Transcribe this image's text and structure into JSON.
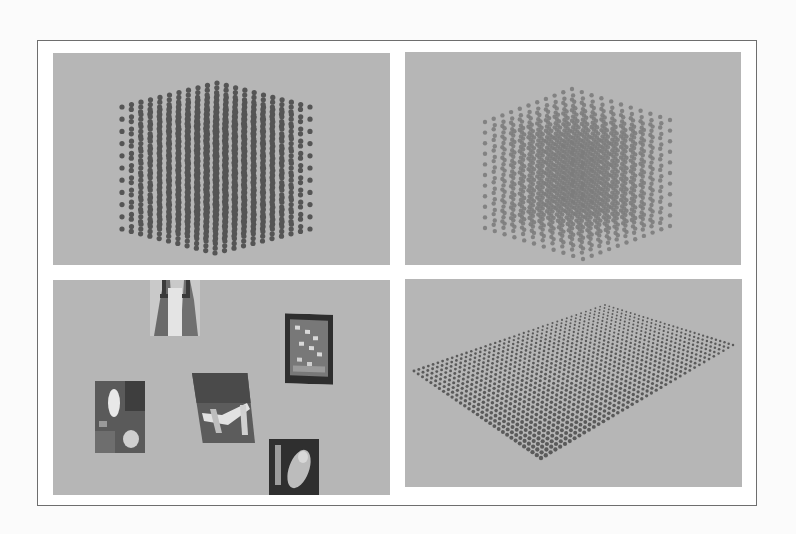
{
  "figure": {
    "layout": "2x2 grid",
    "background_color": "#b6b6b6",
    "panels": [
      {
        "position": "top-left",
        "content": "3D cube lattice of spheres (dense, dark)",
        "dot_color": "#555555",
        "grid_size": 11
      },
      {
        "position": "top-right",
        "content": "3D cube lattice of spheres (lighter, separated)",
        "dot_color": "#7c7c7c",
        "grid_size": 11
      },
      {
        "position": "bottom-left",
        "content": "Floating artwork images in 3D space",
        "images": [
          {
            "name": "artwork-figures",
            "desc": "two figures with robes"
          },
          {
            "name": "artwork-framed-mosaic",
            "desc": "framed mosaic with dark border"
          },
          {
            "name": "artwork-figure-foliage",
            "desc": "pale figure among foliage"
          },
          {
            "name": "artwork-branches",
            "desc": "white branches, skewed"
          },
          {
            "name": "artwork-dark-portrait",
            "desc": "dark portrait with pale figure"
          }
        ]
      },
      {
        "position": "bottom-right",
        "content": "Flat plane grid of spheres in perspective",
        "dot_color": "#555555",
        "grid_rows": 30,
        "grid_cols": 40
      }
    ]
  }
}
